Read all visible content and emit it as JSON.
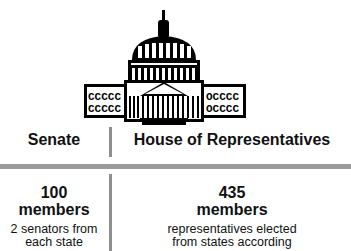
{
  "illustration": {
    "icon": "capitol-building-icon"
  },
  "columns": [
    {
      "heading": "Senate",
      "count": "100",
      "unit": "members",
      "description_lines": [
        "2 senators from",
        "each state"
      ]
    },
    {
      "heading": "House of Representatives",
      "count": "435",
      "unit": "members",
      "description_lines": [
        "representatives elected",
        "from states according"
      ]
    }
  ]
}
